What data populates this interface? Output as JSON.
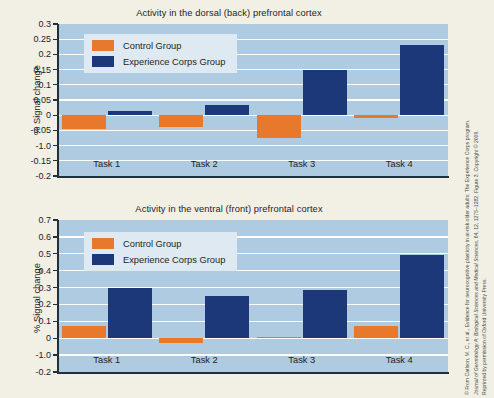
{
  "colors": {
    "page_background": "#f2f0e5",
    "plot_background": "#aecbe1",
    "gridline": "#ffffff",
    "control": "#e8782c",
    "experience": "#1d3878",
    "axis": "#20303c",
    "legend_background": "#dfe9f1",
    "text": "#23231f"
  },
  "legend": {
    "control_label": "Control Group",
    "experience_label": "Experience Corps Group"
  },
  "credit": {
    "line1": "© From Carlson, M. C., et al., Evidence for neurocognitive plasticity in at-risk older adults: The Experience Corps program.",
    "line2_italic": "Journal of Gerontology A: Biological Sciences and Medical Sciences,",
    "line2_rest": " 64, 12, 1275–1282. Figure 3. Copyright © 2009.",
    "line3": "Reprinted by permission of Oxford University Press."
  },
  "chart_data": [
    {
      "type": "bar",
      "title": "Activity in the dorsal (back) prefrontal cortex",
      "xlabel": "",
      "ylabel": "% Signal change",
      "categories": [
        "Task 1",
        "Task 2",
        "Task 3",
        "Task 4"
      ],
      "ylim": [
        -0.2,
        0.3
      ],
      "ytick_labels": [
        "0.3",
        "0.25",
        "0.2",
        "0.15",
        "0.1",
        "0.05",
        "0",
        "-0.05",
        "-1.0",
        "-0.15",
        "-0.2"
      ],
      "ytick_values": [
        0.3,
        0.25,
        0.2,
        0.15,
        0.1,
        0.05,
        0,
        -0.05,
        -0.1,
        -0.15,
        -0.2
      ],
      "grid": true,
      "legend_position": "upper-left",
      "series": [
        {
          "name": "Control Group",
          "values": [
            -0.045,
            -0.04,
            -0.075,
            -0.008
          ]
        },
        {
          "name": "Experience Corps Group",
          "values": [
            0.015,
            0.035,
            0.15,
            0.23
          ]
        }
      ]
    },
    {
      "type": "bar",
      "title": "Activity in the ventral (front) prefrontal cortex",
      "xlabel": "",
      "ylabel": "% Signal change",
      "categories": [
        "Task 1",
        "Task 2",
        "Task 3",
        "Task 4"
      ],
      "ylim": [
        -0.2,
        0.7
      ],
      "ytick_labels": [
        "0.7",
        "0.6",
        "0.5",
        "0.4",
        "0.3",
        "0.2",
        "0.1",
        "0",
        "-1.0",
        "-0.2"
      ],
      "ytick_values": [
        0.7,
        0.6,
        0.5,
        0.4,
        0.3,
        0.2,
        0.1,
        0,
        -0.1,
        -0.2
      ],
      "grid": true,
      "legend_position": "upper-left",
      "series": [
        {
          "name": "Control Group",
          "values": [
            0.075,
            -0.03,
            0.01,
            0.07
          ]
        },
        {
          "name": "Experience Corps Group",
          "values": [
            0.3,
            0.25,
            0.285,
            0.495
          ]
        }
      ]
    }
  ]
}
